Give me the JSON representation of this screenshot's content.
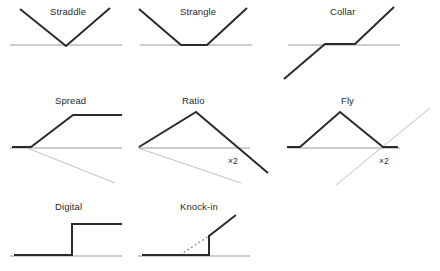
{
  "figure": {
    "background_color": "#ffffff",
    "payoff_color": "#2b2b2b",
    "axis_color": "#9a9a9a",
    "ghost_color": "#c2c2c2"
  },
  "panels": [
    {
      "id": "straddle",
      "label": "Straddle",
      "label_x": 50,
      "label_y": 6,
      "row": 1,
      "column": 1,
      "axis": {
        "x1": 10,
        "y1": 45,
        "x2": 122,
        "y2": 45
      },
      "payoff_points": "20,9 66,46 110,8",
      "ghost_points": "",
      "multiplier_label": "",
      "shape_description": "symmetric V touching the axis at a single strike"
    },
    {
      "id": "strangle",
      "label": "Strangle",
      "label_x": 180,
      "label_y": 6,
      "row": 1,
      "column": 2,
      "axis": {
        "x1": 140,
        "y1": 45,
        "x2": 252,
        "y2": 45
      },
      "payoff_points": "139,9 181,45 207,45 247,8",
      "ghost_points": "",
      "multiplier_label": "",
      "shape_description": "V with a flat trough between two strikes"
    },
    {
      "id": "collar",
      "label": "Collar",
      "label_x": 330,
      "label_y": 6,
      "row": 1,
      "column": 3,
      "axis": {
        "x1": 288,
        "y1": 45,
        "x2": 400,
        "y2": 45
      },
      "payoff_points": "284,79 325,44 355,44 394,7",
      "ghost_points": "",
      "multiplier_label": "",
      "shape_description": "rising line capped by a flat floor and flat ceiling between strikes"
    },
    {
      "id": "spread",
      "label": "Spread",
      "label_x": 55,
      "label_y": 95,
      "row": 2,
      "column": 1,
      "axis": {
        "x1": 10,
        "y1": 148,
        "x2": 122,
        "y2": 148
      },
      "payoff_points": "12,147 31,147 73,115 122,115",
      "ghost_points": "27,148 115,183",
      "multiplier_label": "",
      "shape_description": "flat then rising then flat cap, with a descending ghost leg below the axis"
    },
    {
      "id": "ratio",
      "label": "Ratio",
      "label_x": 182,
      "label_y": 95,
      "row": 2,
      "column": 2,
      "axis": {
        "x1": 138,
        "y1": 148,
        "x2": 250,
        "y2": 148
      },
      "payoff_points": "139,147 196,112 268,173",
      "ghost_points": "138,148 241,183",
      "multiplier_label": "×2",
      "multiplier_x": 228,
      "multiplier_y": 156,
      "shape_description": "peak then a steeper two-times descent crossing below the axis"
    },
    {
      "id": "fly",
      "label": "Fly",
      "label_x": 341,
      "label_y": 95,
      "row": 2,
      "column": 3,
      "axis": {
        "x1": 288,
        "y1": 148,
        "x2": 400,
        "y2": 148
      },
      "payoff_points": "287,147 300,147 340,112 383,147 398,147",
      "ghost_points": "336,185 430,108",
      "multiplier_label": "×2",
      "multiplier_x": 379,
      "multiplier_y": 156,
      "shape_description": "flat wings with a central triangular peak, plus a two-times rising ghost leg"
    },
    {
      "id": "digital",
      "label": "Digital",
      "label_x": 55,
      "label_y": 201,
      "row": 3,
      "column": 1,
      "axis": {
        "x1": 10,
        "y1": 256,
        "x2": 122,
        "y2": 256
      },
      "payoff_points": "14,255 72,255 72,224 122,224",
      "ghost_points": "",
      "multiplier_label": "",
      "shape_description": "flat zero then a vertical step up to a constant payout"
    },
    {
      "id": "knock-in",
      "label": "Knock-in",
      "label_x": 180,
      "label_y": 201,
      "row": 3,
      "column": 2,
      "axis": {
        "x1": 138,
        "y1": 256,
        "x2": 250,
        "y2": 256
      },
      "payoff_points": "142,255 209,255 209,236 236,215",
      "ghost_points": "",
      "dashed_points": "180,255 209,236",
      "multiplier_label": "",
      "shape_description": "flat then a vertical knock-in jump then a rising leg, with the dotted un-knocked line"
    }
  ]
}
